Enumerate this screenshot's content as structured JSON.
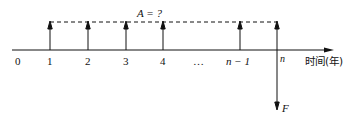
{
  "diagram": {
    "type": "cash-flow-diagram",
    "axis_label": "时间(年)",
    "ticks": [
      "0",
      "1",
      "2",
      "3",
      "4",
      "…",
      "n − 1",
      "n"
    ],
    "annuity_label": "A = ?",
    "future_value_label": "F",
    "upward_arrows_at": [
      "1",
      "2",
      "3",
      "4",
      "n − 1",
      "n"
    ],
    "downward_arrow_at": "n",
    "colors": {
      "line": "#111111",
      "background": "#ffffff"
    }
  }
}
